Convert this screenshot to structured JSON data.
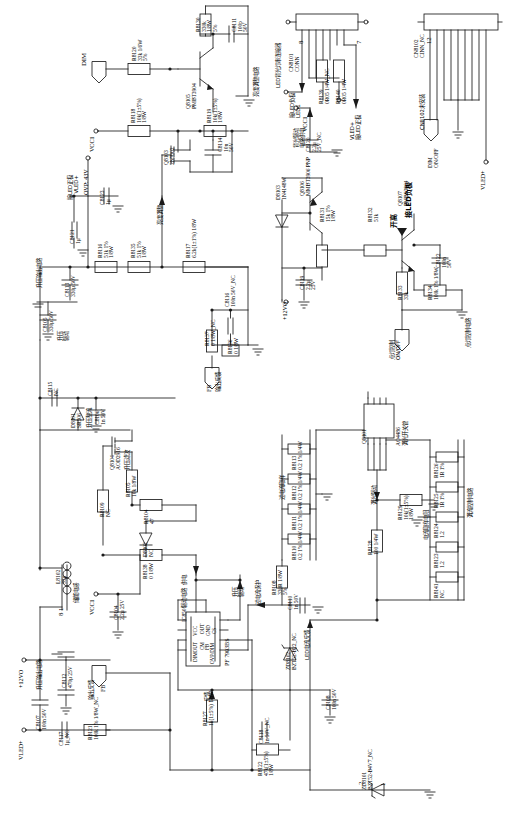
{
  "sheet": {
    "title": "LED 背光驱动电路原理图",
    "orientation": "rotated-90"
  },
  "nets": {
    "dim_in": "DIM",
    "vcc1": "VCC1",
    "vled_plus": "VLED+",
    "led1": "LED1",
    "v12vo": "+12VO",
    "fb": "FB",
    "ovp_note": "OVP: 43V"
  },
  "blocks": [
    {
      "name": "brightness-adjust-circuit",
      "label": "亮度调整电路"
    },
    {
      "name": "brightness-adjust",
      "label": "亮度调整"
    },
    {
      "name": "led-backlight-connector",
      "label": "LED背光灯串连接器"
    },
    {
      "name": "backlight-driver-supply",
      "label": "背光驱动\n电路供电"
    },
    {
      "name": "cn8102-not-installed",
      "label": "CN8102未安装"
    },
    {
      "name": "light-on-control-circuit",
      "label": "点灯控制电路"
    },
    {
      "name": "light-on-control",
      "label": "点灯控制\nON/OFF"
    },
    {
      "name": "boost-output",
      "label": "升压输出"
    },
    {
      "name": "boost-filter",
      "label": "升压滤波"
    },
    {
      "name": "boost-output-circuit",
      "label": "升压输出电路"
    },
    {
      "name": "boost-drive",
      "label": "升压\n驱动"
    },
    {
      "name": "boost-rectify",
      "label": "升压整流"
    },
    {
      "name": "energy-storage-inductor",
      "label": "储能电感"
    },
    {
      "name": "drive-circuit-supply",
      "label": "驱动电路  供电"
    },
    {
      "name": "output-feedback",
      "label": "输出反馈"
    },
    {
      "name": "feedback",
      "label": "反馈"
    },
    {
      "name": "overcurrent-sample",
      "label": "过电流取样"
    },
    {
      "name": "overcurrent-protect",
      "label": "过电流保护"
    },
    {
      "name": "dimming-drive",
      "label": "调光驱动"
    },
    {
      "name": "dimming-switch-tube",
      "label": "调光开关管"
    },
    {
      "name": "current-sample-resistors",
      "label": "电流取样电阻"
    },
    {
      "name": "current-control-circuit",
      "label": "调流控制电路"
    },
    {
      "name": "led-current-feedback",
      "label": "LED电流反馈"
    },
    {
      "name": "connect-led-positive",
      "label": "接LED正极"
    },
    {
      "name": "connect-led-negative",
      "label": "接LED负极"
    },
    {
      "name": "open-high",
      "label": "开高"
    },
    {
      "name": "open-low",
      "label": "开低"
    }
  ],
  "components": [
    {
      "ref": "R8120",
      "value": "33k 1/6W",
      "tol": "5%"
    },
    {
      "ref": "R8130",
      "value": "330k",
      "pwr": "1/8W",
      "tol": "5%"
    },
    {
      "ref": "C8111",
      "value": "100p",
      "volt": "50V"
    },
    {
      "ref": "R8118",
      "value": "10k(1±5%)",
      "pwr": "1/8W"
    },
    {
      "ref": "R8119",
      "value": "10k(1±5%)",
      "pwr": "1/8W"
    },
    {
      "ref": "Q8105",
      "value": "PMBT3904"
    },
    {
      "ref": "Q8103",
      "value": "2N7002"
    },
    {
      "ref": "C8114",
      "value": "10n",
      "volt": "50V"
    },
    {
      "ref": "C8123",
      "value": "1μ"
    },
    {
      "ref": "C8121",
      "value": "1μ"
    },
    {
      "ref": "R8116",
      "value": "51k 1%",
      "pwr": "1/8W"
    },
    {
      "ref": "R8135",
      "value": "51k 1%",
      "pwr": "1/8W"
    },
    {
      "ref": "R8117",
      "value": "6.2k(1±1%) 1/8W"
    },
    {
      "ref": "C8113",
      "value": "330μ 50V"
    },
    {
      "ref": "C8105",
      "value": "330μ 50V"
    },
    {
      "ref": "C8116",
      "value": "100n 50V_NC"
    },
    {
      "ref": "R8136",
      "value": "0 1/8W"
    },
    {
      "ref": "R8137",
      "value": "0 1/8W_NC"
    },
    {
      "ref": "C8115",
      "value": "NC"
    },
    {
      "ref": "D8101",
      "value": "SR506"
    },
    {
      "ref": "C8106",
      "value": "1n 50V"
    },
    {
      "ref": "Q8104",
      "value": "AOD2916"
    },
    {
      "ref": "R8105",
      "value": "10k 1/8W"
    },
    {
      "ref": "R8104",
      "value": "47"
    },
    {
      "ref": "R8109",
      "value": "NC"
    },
    {
      "ref": "D8102",
      "value": "NC"
    },
    {
      "ref": "R8138",
      "value": "0 1/8W"
    },
    {
      "ref": "L8102",
      "value": "33μ"
    },
    {
      "ref": "C8104",
      "value": "2.2μ 25V"
    },
    {
      "ref": "C8112",
      "value": "470μ 25V"
    },
    {
      "ref": "C8107",
      "value": "100n 50V"
    },
    {
      "ref": "C8117",
      "value": "1μ_NC"
    },
    {
      "ref": "R8121",
      "value": "100k 1% 1/8W_NC"
    },
    {
      "ref": "R8127",
      "value": "1k(1±5%) 1/8W"
    },
    {
      "ref": "R8122",
      "value": "47k(1±5%) 1/8W"
    },
    {
      "ref": "C8118",
      "value": "1n 50V_NC"
    },
    {
      "ref": "C8108",
      "value": "100n 50V"
    },
    {
      "ref": "ZD8102",
      "value": "BZT52-B22_NC"
    },
    {
      "ref": "ZD8101",
      "value": "BZT52-B4V7_NC"
    },
    {
      "ref": "IC8501",
      "value": "PF 7903BS"
    },
    {
      "ref": "R8108",
      "value": "330R 1/8W",
      "tol": "5%"
    },
    {
      "ref": "C8110",
      "value": "1n 50V"
    },
    {
      "ref": "R8110",
      "value": "0.2 1% 1/4W"
    },
    {
      "ref": "R8111",
      "value": "0.2 1% 1/4W"
    },
    {
      "ref": "R8112",
      "value": "0.2 1% 1/4W"
    },
    {
      "ref": "R8113",
      "value": "0.2 1% 1/4W"
    },
    {
      "ref": "Q8101",
      "value": "AO4486"
    },
    {
      "ref": "R8128",
      "value": "100 1/4W"
    },
    {
      "ref": "R8129",
      "value": "10k(1±5%) 1/8W"
    },
    {
      "ref": "R8141",
      "value": "NC"
    },
    {
      "ref": "R8123",
      "value": "1.2"
    },
    {
      "ref": "R8124",
      "value": "1.2"
    },
    {
      "ref": "R8125",
      "value": "1R 1%"
    },
    {
      "ref": "R8126",
      "value": "1R 1%"
    },
    {
      "ref": "CN8101",
      "value": "CONN"
    },
    {
      "ref": "CN8102",
      "value": "CINN_NC"
    },
    {
      "ref": "R8139",
      "value": "0R05 1/4W_NC"
    },
    {
      "ref": "R8140",
      "value": "0R05 1/4W"
    },
    {
      "ref": "C8120",
      "value": "2.2μ 25V_NC"
    },
    {
      "ref": "D8103",
      "value": "1N4148W"
    },
    {
      "ref": "Q8106",
      "value": "MMBT3906 PNP"
    },
    {
      "ref": "R8131",
      "value": "15k 1% 1/8W"
    },
    {
      "ref": "C8119",
      "value": "2.2μ 25V"
    },
    {
      "ref": "R8132",
      "value": "51k"
    },
    {
      "ref": "Q8107",
      "value": "PMBS3904"
    },
    {
      "ref": "R8133",
      "value": "33k"
    },
    {
      "ref": "R8134",
      "value": "100k 1% 1/8W"
    },
    {
      "ref": "C8122",
      "value": "100n 50V"
    }
  ],
  "ic_pins": {
    "left_col": [
      "DIMOUT",
      "CM",
      "FB",
      "OVP/DIM"
    ],
    "right_col": [
      "VCC",
      "OUT",
      "GND",
      "CS"
    ],
    "part": "PF 7903BS",
    "ref": "IC8501"
  },
  "labels": {
    "dim_pin": "DIM",
    "onoff_pin": "ON/OFF",
    "vled_pin": "VLED+",
    "fb_pin": "FB",
    "led1_pin": "LED1",
    "pin8": "8",
    "pin7": "7",
    "pin1": "1",
    "pin2": "2",
    "pin12": "12"
  },
  "colors": {
    "line": "#1a1a1a",
    "text": "#000000",
    "bg": "#ffffff"
  }
}
